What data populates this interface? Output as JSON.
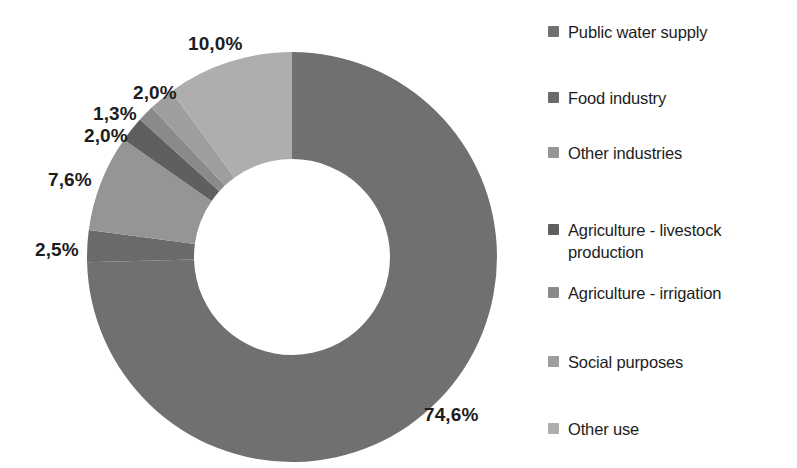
{
  "chart_data": {
    "type": "pie",
    "variant": "donut",
    "title": "",
    "subtitle": "",
    "xlabel": "",
    "ylabel": "",
    "grid": false,
    "legend_position": "right",
    "decimal_separator": ",",
    "value_unit": "%",
    "start_angle_deg": 0,
    "direction": "clockwise",
    "inner_radius_ratio": 0.48,
    "categories": [
      "Public water supply",
      "Food industry",
      "Other industries",
      "Agriculture - livestock production",
      "Agriculture - irrigation",
      "Social purposes",
      "Other use"
    ],
    "values": [
      74.6,
      2.5,
      7.6,
      2.0,
      1.3,
      2.0,
      10.0
    ],
    "data_labels": [
      "74,6%",
      "2,5%",
      "7,6%",
      "2,0%",
      "1,3%",
      "2,0%",
      "10,0%"
    ],
    "colors": [
      "#707070",
      "#6a6a6a",
      "#959595",
      "#5f5f5f",
      "#8a8a8a",
      "#9e9e9e",
      "#aeaeae"
    ],
    "total": 100.0
  },
  "legend": {
    "items": [
      {
        "label": "Public water supply",
        "color": "#707070",
        "value": "74,6%"
      },
      {
        "label": "Food industry",
        "color": "#6a6a6a",
        "value": "2,5%"
      },
      {
        "label": "Other industries",
        "color": "#959595",
        "value": "7,6%"
      },
      {
        "label": "Agriculture - livestock production",
        "color": "#5f5f5f",
        "value": "2,0%"
      },
      {
        "label": "Agriculture - irrigation",
        "color": "#8a8a8a",
        "value": "1,3%"
      },
      {
        "label": "Social purposes",
        "color": "#9e9e9e",
        "value": "2,0%"
      },
      {
        "label": "Other use",
        "color": "#aeaeae",
        "value": "10,0%"
      }
    ]
  },
  "callouts": [
    {
      "text": "10,0%",
      "left": 188,
      "top": 33
    },
    {
      "text": "2,0%",
      "left": 133,
      "top": 82
    },
    {
      "text": "1,3%",
      "left": 93,
      "top": 103
    },
    {
      "text": "2,0%",
      "left": 84,
      "top": 125
    },
    {
      "text": "7,6%",
      "left": 48,
      "top": 169
    },
    {
      "text": "2,5%",
      "left": 35,
      "top": 239
    },
    {
      "text": "74,6%",
      "left": 424,
      "top": 404
    }
  ],
  "geometry": {
    "center_x": 292,
    "center_y": 257,
    "outer_radius": 205,
    "inner_radius": 98,
    "canvas_width": 520,
    "canvas_height": 468
  },
  "legend_layout": {
    "tops": [
      22,
      88,
      143,
      220,
      283,
      352,
      419
    ]
  }
}
